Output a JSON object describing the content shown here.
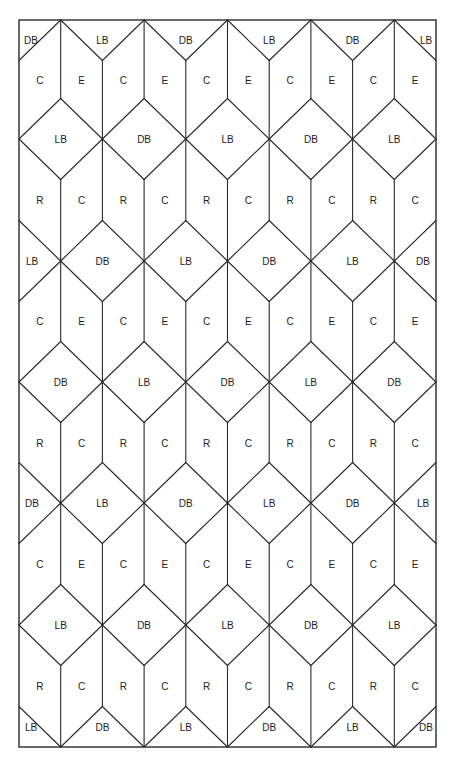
{
  "diagram": {
    "type": "quilt-piecing-layout",
    "frame": {
      "left": 19,
      "top": 20,
      "right": 436,
      "bottom": 747
    },
    "columns": 10,
    "legend_codes": [
      "DB",
      "LB",
      "C",
      "E",
      "R"
    ],
    "top_triangles": [
      "DB",
      "LB",
      "DB",
      "LB",
      "DB",
      "LB"
    ],
    "rows": [
      {
        "kind": "strip",
        "y": 80,
        "labels": [
          "C",
          "E",
          "C",
          "E",
          "C",
          "E",
          "C",
          "E",
          "C",
          "E"
        ]
      },
      {
        "kind": "diamonds-odd",
        "y": 139,
        "labels": [
          "LB",
          "DB",
          "LB",
          "DB",
          "LB"
        ]
      },
      {
        "kind": "strip",
        "y": 200,
        "labels": [
          "R",
          "C",
          "R",
          "C",
          "R",
          "C",
          "R",
          "C",
          "R",
          "C"
        ]
      },
      {
        "kind": "diamonds-even",
        "y": 261,
        "labels": [
          "LB",
          "DB",
          "LB",
          "DB",
          "LB",
          "DB"
        ]
      },
      {
        "kind": "strip",
        "y": 321,
        "labels": [
          "C",
          "E",
          "C",
          "E",
          "C",
          "E",
          "C",
          "E",
          "C",
          "E"
        ]
      },
      {
        "kind": "diamonds-odd",
        "y": 382,
        "labels": [
          "DB",
          "LB",
          "DB",
          "LB",
          "DB"
        ]
      },
      {
        "kind": "strip",
        "y": 443,
        "labels": [
          "R",
          "C",
          "R",
          "C",
          "R",
          "C",
          "R",
          "C",
          "R",
          "C"
        ]
      },
      {
        "kind": "diamonds-even",
        "y": 503,
        "labels": [
          "DB",
          "LB",
          "DB",
          "LB",
          "DB",
          "LB"
        ]
      },
      {
        "kind": "strip",
        "y": 564,
        "labels": [
          "C",
          "E",
          "C",
          "E",
          "C",
          "E",
          "C",
          "E",
          "C",
          "E"
        ]
      },
      {
        "kind": "diamonds-odd",
        "y": 625,
        "labels": [
          "LB",
          "DB",
          "LB",
          "DB",
          "LB"
        ]
      },
      {
        "kind": "strip",
        "y": 686,
        "labels": [
          "R",
          "C",
          "R",
          "C",
          "R",
          "C",
          "R",
          "C",
          "R",
          "C"
        ]
      }
    ],
    "bottom_triangles": [
      "LB",
      "DB",
      "LB",
      "DB",
      "LB",
      "DB"
    ]
  }
}
